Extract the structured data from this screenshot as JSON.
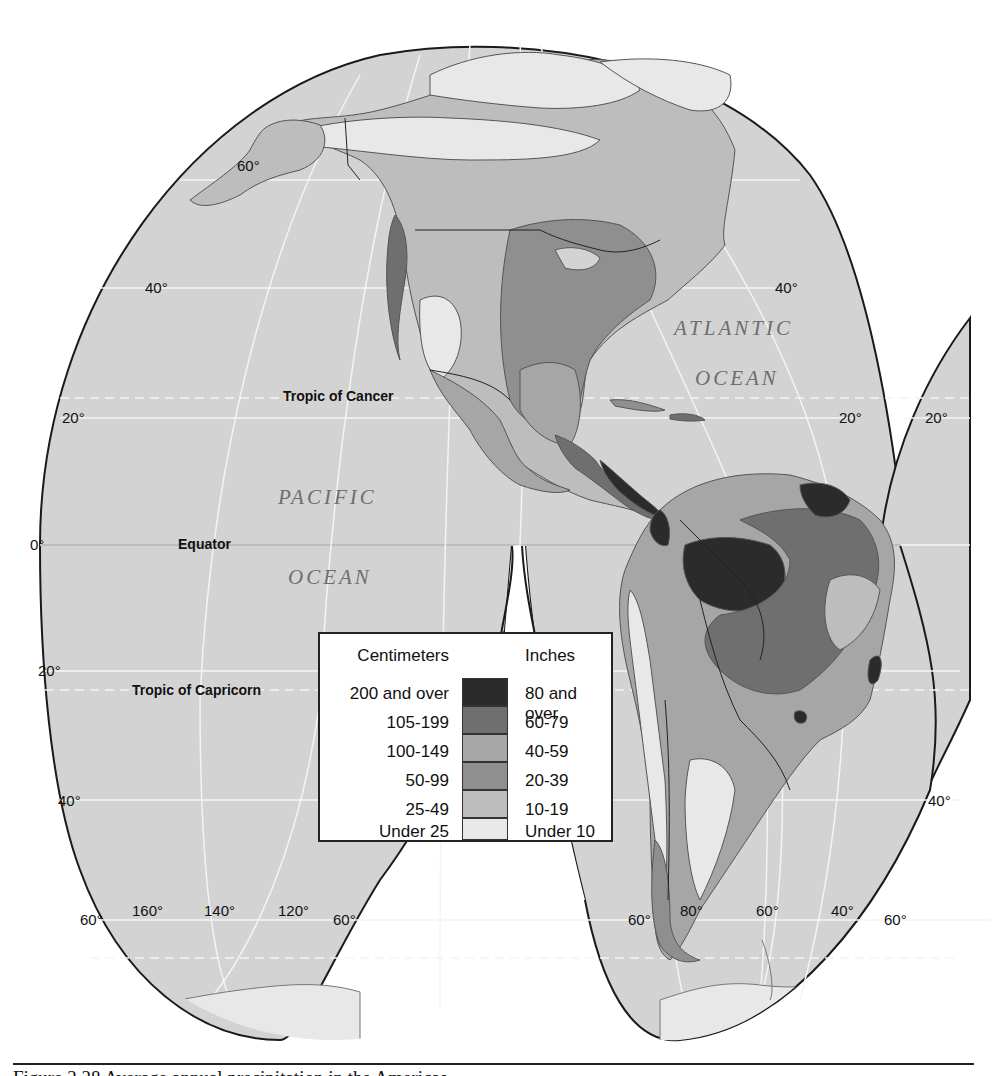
{
  "map": {
    "title": "Average annual precipitation – North and South America",
    "projection": "Goode interrupted homolosine (Western Hemisphere lobes)",
    "colors": {
      "ocean": "#d3d3d3",
      "outline": "#1a1a1a",
      "graticule": "#f4f4f4",
      "land_under_10": "#e8e8e8",
      "land_10_19": "#bdbdbd",
      "land_20_39": "#8f8f8f",
      "land_40_59": "#a6a6a6",
      "land_60_79": "#6f6f6f",
      "land_80_over": "#2b2b2b"
    },
    "oceans": [
      {
        "name": "pacific",
        "line1": "PACIFIC",
        "line2": "OCEAN"
      },
      {
        "name": "atlantic",
        "line1": "ATLANTIC",
        "line2": "OCEAN"
      }
    ],
    "reference_lines": {
      "tropic_cancer": "Tropic of Cancer",
      "equator": "Equator",
      "tropic_capricorn": "Tropic of Capricorn"
    },
    "latitude_labels": {
      "left_60n": "60°",
      "left_40n": "40°",
      "left_20n": "20°",
      "left_0": "0°",
      "left_20s": "20°",
      "left_40s": "40°",
      "right_40n": "40°",
      "right_20n_a": "20°",
      "right_20n_b": "20°",
      "right_40s": "40°"
    },
    "bottom_labels": {
      "lobe1_60s_left": "60°",
      "lon_160": "160°",
      "lon_140": "140°",
      "lon_120": "120°",
      "lobe1_60s_right": "60°",
      "lobe2_60s_left": "60°",
      "lon_80": "80°",
      "lon_60": "60°",
      "lon_40": "40°",
      "lobe2_60s_right": "60°"
    }
  },
  "legend": {
    "header_cm": "Centimeters",
    "header_in": "Inches",
    "rows": [
      {
        "cm": "200 and over",
        "in": "80 and over",
        "color": "#2b2b2b"
      },
      {
        "cm": "105-199",
        "in": "60-79",
        "color": "#6f6f6f"
      },
      {
        "cm": "100-149",
        "in": "40-59",
        "color": "#a6a6a6"
      },
      {
        "cm": "50-99",
        "in": "20-39",
        "color": "#8f8f8f"
      },
      {
        "cm": "25-49",
        "in": "10-19",
        "color": "#bdbdbd"
      },
      {
        "cm": "Under 25",
        "in": "Under 10",
        "color": "#e8e8e8"
      }
    ]
  },
  "caption": {
    "text": "Figure 2.28   Average annual precipitation in the Americas"
  }
}
